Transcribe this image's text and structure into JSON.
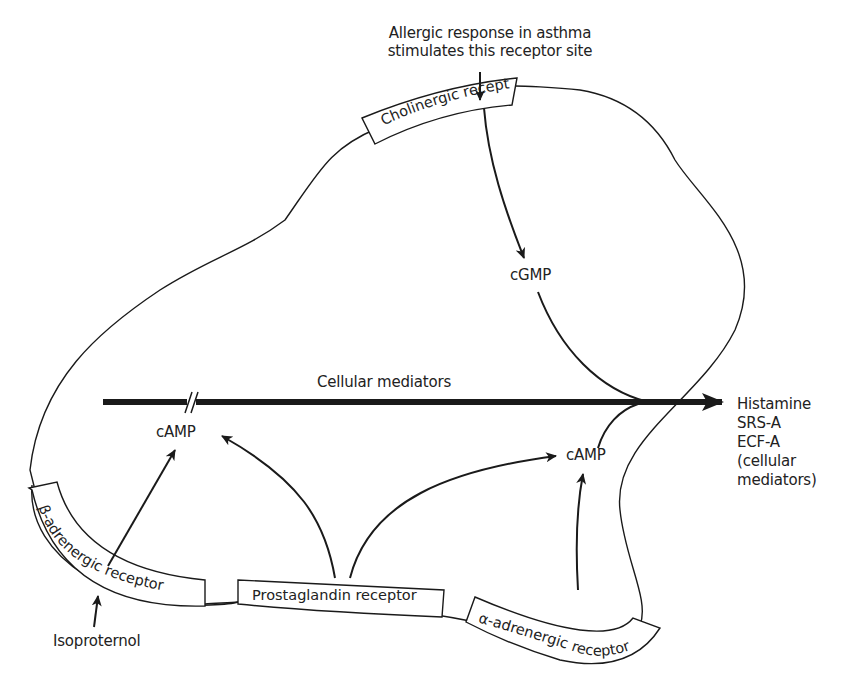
{
  "diagram": {
    "title": "",
    "top_annotation": {
      "line1": "Allergic response in asthma",
      "line2": "stimulates this receptor site"
    },
    "receptors": {
      "cholinergic": "Cholinergic receptor",
      "beta_adrenergic": "β-adrenergic receptor",
      "prostaglandin": "Prostaglandin receptor",
      "alpha_adrenergic": "α-adrenergic receptor"
    },
    "second_messengers": {
      "cgmp": "cGMP",
      "camp_left": "cAMP",
      "camp_right": "cAMP"
    },
    "main_pathway": {
      "label": "Cellular mediators"
    },
    "outputs": {
      "line1": "Histamine",
      "line2": "SRS-A",
      "line3": "ECF-A",
      "line4": "(cellular",
      "line5": "mediators)"
    },
    "stimulus": {
      "isoproterenol": "Isoproternol"
    },
    "colors": {
      "stroke": "#1a1a1a",
      "background": "#ffffff"
    }
  }
}
